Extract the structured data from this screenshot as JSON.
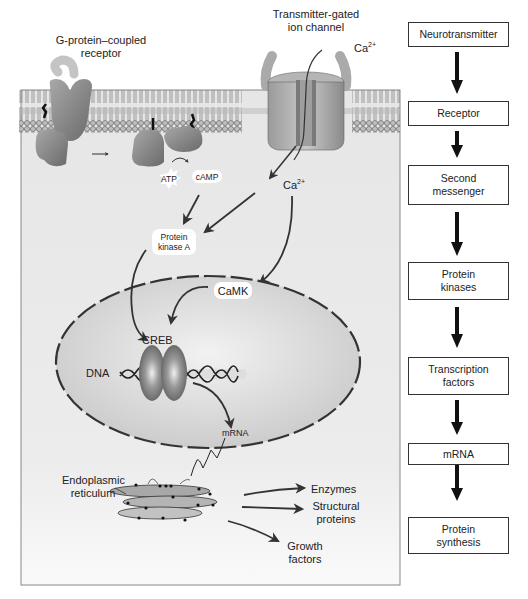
{
  "diagram": {
    "labels": {
      "gpcr": "G-protein–coupled receptor",
      "ion_channel": "Transmitter-gated ion channel",
      "ca_outside": "Ca",
      "ca_outside_sup": "2+",
      "ca_inside": "Ca",
      "ca_inside_sup": "2+",
      "atp": "ATP",
      "camp": "cAMP",
      "pka": "Protein kinase A",
      "camk": "CaMK",
      "creb": "CREB",
      "dna": "DNA",
      "mrna": "mRNA",
      "er": "Endoplasmic reticulum",
      "enzymes": "Enzymes",
      "structural": "Structural proteins",
      "growth": "Growth factors"
    },
    "flowchart": [
      {
        "label": "Neurotransmitter"
      },
      {
        "label": "Receptor"
      },
      {
        "label": "Second messenger"
      },
      {
        "label": "Protein kinases"
      },
      {
        "label": "Transcription factors"
      },
      {
        "label": "mRNA"
      },
      {
        "label": "Protein synthesis"
      }
    ]
  }
}
